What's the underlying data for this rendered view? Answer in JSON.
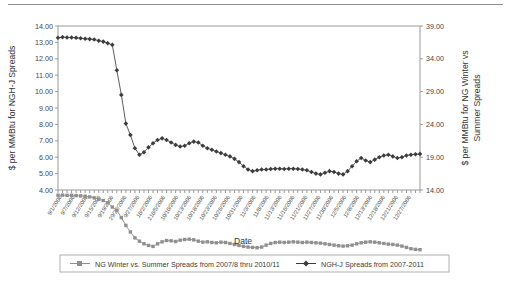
{
  "chart_data": {
    "type": "line",
    "title": "",
    "xlabel": "Date",
    "ylabel": "$ per MMBtu for NGH-J Spreads",
    "y2label": "$ per MMBtu for NG Winter vs Summer Spreads",
    "ylim": [
      4.0,
      14.0
    ],
    "yticks": [
      "4.00",
      "5.00",
      "6.00",
      "7.00",
      "8.00",
      "9.00",
      "10.00",
      "11.00",
      "12.00",
      "13.00",
      "14.00"
    ],
    "y2lim": [
      14.0,
      39.0
    ],
    "y2ticks": [
      "14.00",
      "19.00",
      "24.00",
      "29.00",
      "34.00",
      "39.00"
    ],
    "grid": false,
    "legend_position": "bottom",
    "xtick_labels": [
      "9/1/2006",
      "9/7/2006",
      "9/12/2006",
      "9/15/2006",
      "9/19/2006",
      "29/22/2006",
      "9/27/2006",
      "10/2/2006",
      "210/5/2006",
      "10/10/2006",
      "10/13/2006",
      "10/18/2006",
      "10/23/2006",
      "10/26/2006",
      "10/31/2006",
      "11/3/2006",
      "11/8/2006",
      "11/13/2006",
      "11/16/2006",
      "11/21/2006",
      "11/27/2006",
      "11/30/2006",
      "12/5/2006",
      "12/8/2006",
      "12/13/2006",
      "12/18/2006",
      "12/21/2006",
      "12/27/2006"
    ],
    "series": [
      {
        "name": "NG Winter vs. Summer Spreads from 2007/8 thru 2010/11",
        "axis": "right",
        "color": "#8f8f8f",
        "marker": "square",
        "values": [
          13.2,
          13.22,
          13.18,
          13.2,
          13.15,
          13.1,
          13.05,
          12.95,
          12.8,
          12.6,
          12.4,
          12.05,
          11.4,
          10.9,
          9.8,
          8.6,
          7.6,
          6.7,
          6.2,
          5.8,
          5.55,
          5.4,
          5.8,
          6.1,
          6.3,
          6.25,
          6.15,
          6.35,
          6.45,
          6.5,
          6.4,
          6.2,
          6.05,
          6.1,
          6.0,
          5.95,
          6.05,
          6.0,
          5.85,
          5.7,
          5.55,
          5.4,
          5.3,
          5.25,
          5.2,
          5.3,
          5.6,
          5.85,
          6.0,
          6.05,
          6.0,
          6.05,
          6.1,
          6.05,
          6.0,
          6.05,
          6.0,
          5.95,
          5.9,
          5.8,
          5.7,
          5.6,
          5.5,
          5.45,
          5.5,
          5.6,
          5.8,
          5.95,
          6.05,
          6.1,
          6.05,
          5.95,
          5.85,
          5.75,
          5.7,
          5.6,
          5.45,
          5.25,
          5.05,
          4.95,
          4.9
        ]
      },
      {
        "name": "NGH-J Spreads from 2007-2011",
        "axis": "left",
        "color": "#3c3c3c",
        "marker": "diamond",
        "values": [
          13.28,
          13.32,
          13.3,
          13.3,
          13.28,
          13.25,
          13.22,
          13.2,
          13.18,
          13.1,
          13.05,
          12.95,
          12.85,
          11.3,
          9.8,
          8.05,
          7.35,
          6.55,
          6.15,
          6.3,
          6.6,
          6.85,
          7.05,
          7.15,
          7.05,
          6.9,
          6.75,
          6.65,
          6.7,
          6.85,
          6.95,
          6.9,
          6.7,
          6.55,
          6.45,
          6.35,
          6.25,
          6.15,
          6.05,
          5.9,
          5.7,
          5.45,
          5.25,
          5.15,
          5.2,
          5.25,
          5.25,
          5.28,
          5.3,
          5.3,
          5.28,
          5.3,
          5.3,
          5.28,
          5.25,
          5.2,
          5.1,
          5.0,
          4.95,
          5.05,
          5.15,
          5.1,
          5.0,
          4.95,
          5.15,
          5.45,
          5.75,
          5.95,
          5.8,
          5.7,
          5.85,
          6.0,
          6.1,
          6.15,
          6.05,
          5.95,
          6.0,
          6.1,
          6.15,
          6.18,
          6.2
        ]
      }
    ]
  },
  "legend": {
    "items": [
      {
        "label": "NG Winter vs. Summer Spreads from 2007/8 thru 2010/11",
        "marker": "square-marker"
      },
      {
        "label": "NGH-J Spreads from 2007-2011",
        "marker": "diamond-marker"
      }
    ]
  }
}
